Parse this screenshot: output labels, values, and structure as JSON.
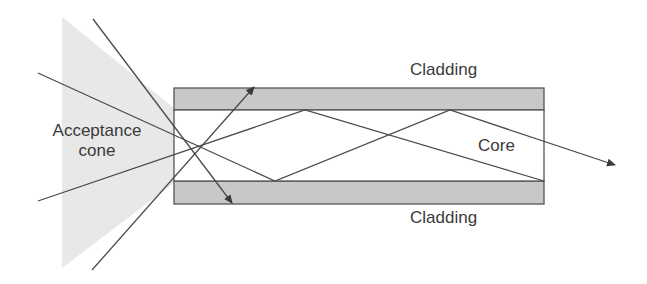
{
  "diagram": {
    "labels": {
      "acceptance_cone": [
        "Acceptance",
        "cone"
      ],
      "cladding_top": "Cladding",
      "cladding_bottom": "Cladding",
      "core": "Core"
    },
    "colors": {
      "cladding_fill": "#c8c8c8",
      "cone_fill": "#e6e6e6",
      "line": "#4a4a4a",
      "text": "#3a3a3a"
    }
  }
}
